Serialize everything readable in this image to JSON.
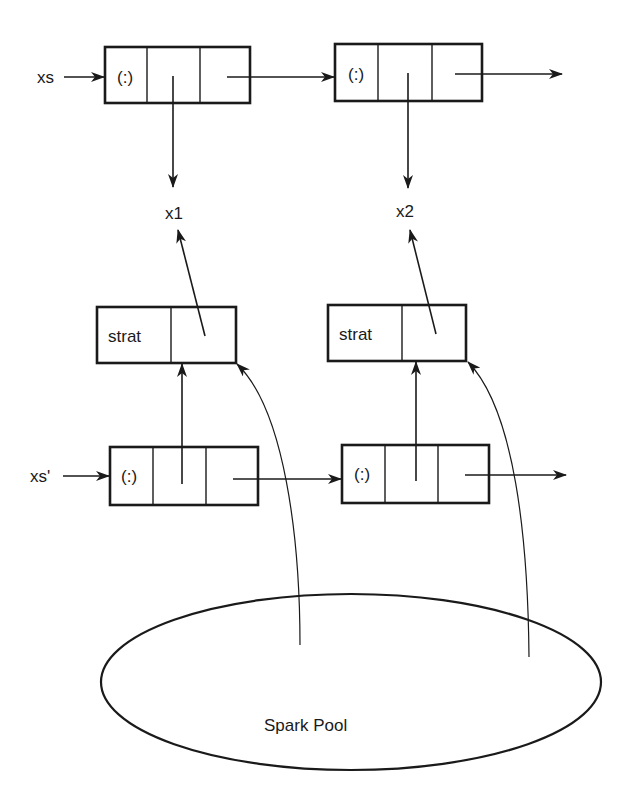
{
  "diagram": {
    "colors": {
      "stroke": "#1a1a1a",
      "background": "#ffffff"
    },
    "list_xs": {
      "label": "xs",
      "cells": [
        {
          "tag": "(:)",
          "head_points_to": "x1"
        },
        {
          "tag": "(:)",
          "head_points_to": "x2"
        }
      ]
    },
    "values": [
      {
        "label": "x1"
      },
      {
        "label": "x2"
      }
    ],
    "strat_nodes": [
      {
        "label": "strat",
        "points_to": "x1"
      },
      {
        "label": "strat",
        "points_to": "x2"
      }
    ],
    "list_xs_prime": {
      "label": "xs'",
      "cells": [
        {
          "tag": "(:)",
          "head_points_to": "strat 1"
        },
        {
          "tag": "(:)",
          "head_points_to": "strat 2"
        }
      ]
    },
    "spark_pool": {
      "label": "Spark Pool",
      "sparks_point_to": [
        "strat 1",
        "strat 2"
      ]
    }
  }
}
